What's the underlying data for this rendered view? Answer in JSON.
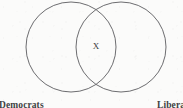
{
  "figure": {
    "type": "venn-diagram",
    "sets": [
      {
        "id": "left",
        "label": "Democrats",
        "label_clipped": true
      },
      {
        "id": "right",
        "label": "Liberals",
        "label_clipped": true,
        "visible_text": "Liber"
      }
    ],
    "intersection": {
      "marker": "X",
      "marker_name": "x-mark"
    },
    "colors": {
      "background": "#fbfbfa",
      "circle_stroke": "#6d6d70",
      "text": "#3f3f42",
      "marker": "#3a3a3c"
    },
    "geometry": {
      "left_circle": {
        "cx": 71,
        "cy": 47,
        "r": 45
      },
      "right_circle": {
        "cx": 121,
        "cy": 47,
        "r": 45
      }
    }
  }
}
